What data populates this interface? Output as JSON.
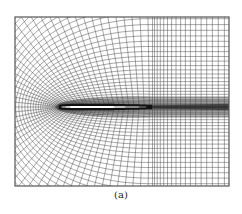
{
  "figure": {
    "type": "C-grid computational mesh around airfoil",
    "caption": "(a)",
    "frame": {
      "x": 15,
      "y": 17,
      "width": 214,
      "height": 169
    },
    "airfoil": {
      "leading_edge_x": 61,
      "trailing_edge_x": 152,
      "center_y": 107,
      "thickness": 13
    },
    "colors": {
      "grid_line": "#3a3a3a",
      "frame": "#555555",
      "airfoil_fill": "#ffffff",
      "background": "#ffffff"
    }
  }
}
